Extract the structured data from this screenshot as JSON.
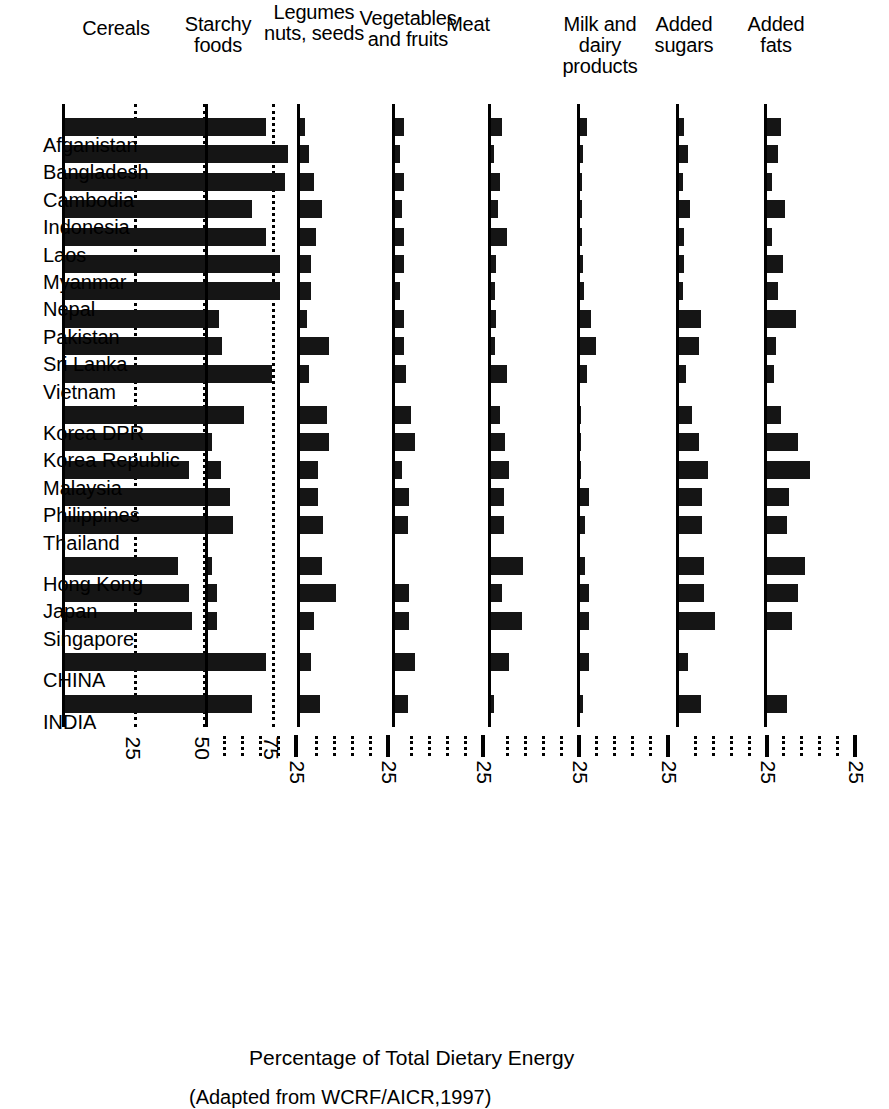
{
  "figure": {
    "axis_title": "Percentage of Total Dietary Energy",
    "source_note": "(Adapted from WCRF/AICR,1997)"
  },
  "chart_data": {
    "type": "bar",
    "title": "Percentage of Total Dietary Energy",
    "subtitle": "(Adapted from WCRF/AICR,1997)",
    "xlabel": "",
    "ylabel": "Percentage of Total Dietary Energy",
    "orientation": "horizontal-multipanel",
    "grid": true,
    "legend": "none",
    "categories": [
      "Afganistan",
      "Bangladesh",
      "Cambodia",
      "Indonesia",
      "Laos",
      "Myanmar",
      "Nepal",
      "Pakistan",
      "Sri Lanka",
      "Vietnam",
      "Korea DPR",
      "Korea Republic",
      "Malaysia",
      "Philippines",
      "Thailand",
      "Hong Kong",
      "Japan",
      "Singapore",
      "CHINA",
      "INDIA"
    ],
    "category_groups": [
      {
        "after_index": 9,
        "gap": true
      },
      {
        "after_index": 14,
        "gap": true
      },
      {
        "after_index": 17,
        "gap": true
      },
      {
        "after_index": 18,
        "gap": true
      }
    ],
    "panels": [
      {
        "name": "cereals",
        "label": "Cereals",
        "label_lines": [
          "Cereals"
        ],
        "xlim": [
          0,
          90
        ],
        "ticks": [
          25,
          50,
          75
        ],
        "tick_labels": [
          "25",
          "50",
          "75"
        ],
        "gridlines": [
          25,
          50,
          75
        ],
        "values": [
          73,
          81,
          80,
          68,
          73,
          78,
          78,
          56,
          54,
          75,
          65,
          53,
          45,
          60,
          61,
          41,
          45,
          46,
          73,
          68
        ]
      },
      {
        "name": "starchy-foods",
        "label": "Starchy foods",
        "label_lines": [
          "Starchy",
          "foods"
        ],
        "xlim": [
          0,
          30
        ],
        "ticks": [
          25
        ],
        "tick_labels": [
          "25"
        ],
        "gridlines": [],
        "values": [
          1.5,
          1.5,
          4,
          5,
          4,
          1.5,
          2,
          1,
          4,
          6,
          3,
          1,
          3.5,
          4.5,
          3,
          1,
          2.5,
          2.5,
          4,
          1.5
        ]
      },
      {
        "name": "legumes-nuts-seeds",
        "label": "Legumes nuts, seeds",
        "label_lines": [
          "Legumes",
          "nuts, seeds"
        ],
        "xlim": [
          0,
          30
        ],
        "ticks": [
          25
        ],
        "tick_labels": [
          "25"
        ],
        "gridlines": [],
        "values": [
          1.5,
          2.5,
          4,
          6,
          4.5,
          3,
          3,
          2,
          8,
          2.5,
          7.5,
          8,
          5,
          5,
          6.5,
          6,
          10,
          4,
          3,
          5.5
        ]
      },
      {
        "name": "vegetables-and-fruits",
        "label": "Vegetables and fruits",
        "label_lines": [
          "Vegetables",
          "and fruits"
        ],
        "xlim": [
          0,
          30
        ],
        "ticks": [
          25
        ],
        "tick_labels": [
          "25"
        ],
        "gridlines": [],
        "values": [
          2.5,
          1.5,
          2.5,
          2,
          2.5,
          2.5,
          1.5,
          2.5,
          2.5,
          3,
          4.5,
          5.5,
          2,
          4,
          3.5,
          0,
          4,
          4,
          5.5,
          3.5,
          4
        ]
      },
      {
        "name": "meat",
        "label": "Meat",
        "label_lines": [
          "Meat"
        ],
        "xlim": [
          0,
          30
        ],
        "ticks": [
          25
        ],
        "tick_labels": [
          "25"
        ],
        "gridlines": [],
        "values": [
          3,
          0.8,
          2.5,
          2,
          4.5,
          1.5,
          1,
          1.5,
          1,
          4.5,
          2.5,
          4,
          5,
          3.5,
          3.5,
          9,
          3,
          8.5,
          5,
          0.8
        ]
      },
      {
        "name": "milk-and-dairy-products",
        "label": "Milk and dairy products",
        "label_lines": [
          "Milk and",
          "dairy",
          "products"
        ],
        "xlim": [
          0,
          30
        ],
        "ticks": [
          25
        ],
        "tick_labels": [
          "25"
        ],
        "gridlines": [],
        "values": [
          2,
          0.8,
          0.6,
          0.6,
          0.6,
          0.8,
          1,
          3,
          4.5,
          2,
          0.4,
          0.4,
          0.4,
          2.5,
          1.5,
          1.5,
          2.5,
          2.5,
          2.5,
          0.8,
          3.5
        ]
      },
      {
        "name": "added-sugars",
        "label": "Added sugars",
        "label_lines": [
          "Added",
          "sugars"
        ],
        "xlim": [
          0,
          30
        ],
        "ticks": [
          25
        ],
        "tick_labels": [
          "25"
        ],
        "gridlines": [],
        "values": [
          1.5,
          2.5,
          1,
          3,
          1.5,
          1.5,
          1,
          6,
          5.5,
          2,
          3.5,
          5.5,
          8,
          6.5,
          6.5,
          7,
          7,
          10,
          2.5,
          6
        ]
      },
      {
        "name": "added-fats",
        "label": "Added fats",
        "label_lines": [
          "Added",
          "fats"
        ],
        "xlim": [
          0,
          30
        ],
        "ticks": [
          25
        ],
        "tick_labels": [
          "25"
        ],
        "gridlines": [],
        "values": [
          4,
          3,
          1.5,
          5,
          1.5,
          4.5,
          3,
          8,
          2.5,
          2,
          4,
          8.5,
          12,
          6,
          5.5,
          10.5,
          8.5,
          7,
          0,
          5.5,
          6
        ]
      }
    ]
  }
}
